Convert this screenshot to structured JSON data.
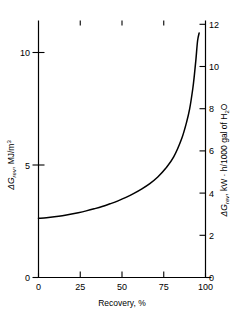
{
  "chart_data": {
    "type": "line",
    "title": "",
    "xlabel": "Recovery, %",
    "ylabel": "ΔG_rev, MJ/m3",
    "ylabel2": "ΔG_rev, kW · h/1000 gal of H2O",
    "xlim": [
      0,
      105
    ],
    "ylim": [
      0,
      11.3
    ],
    "ylim2": [
      0,
      12.6
    ],
    "grid": false,
    "legend": null,
    "xticks": [
      0,
      25,
      50,
      75,
      100
    ],
    "xtick_labels": [
      "0",
      "25",
      "50",
      "75",
      "100"
    ],
    "yticks": [
      0,
      5,
      10
    ],
    "ytick_labels": [
      "0",
      "5",
      "10"
    ],
    "yticks2": [
      0,
      2,
      4,
      6,
      8,
      10,
      12
    ],
    "ytick_labels2": [
      "0",
      "2",
      "4",
      "6",
      "8",
      "10",
      "12"
    ],
    "series": [
      {
        "name": "Reversible free energy of separation",
        "x": [
          0,
          5,
          10,
          15,
          20,
          25,
          30,
          35,
          40,
          45,
          50,
          55,
          60,
          65,
          70,
          75,
          80,
          85,
          90,
          93,
          95,
          97,
          98,
          99,
          100,
          101
        ],
        "values": [
          2.6,
          2.63,
          2.67,
          2.72,
          2.78,
          2.85,
          2.93,
          3.02,
          3.12,
          3.24,
          3.37,
          3.52,
          3.7,
          3.9,
          4.13,
          4.42,
          4.8,
          5.3,
          6.1,
          6.8,
          7.4,
          8.3,
          8.9,
          9.6,
          10.4,
          10.75
        ]
      }
    ]
  },
  "axes": {
    "left": {
      "symbol": "ΔG",
      "subscript": "rev",
      "separator": ", ",
      "unit_main": "MJ/m",
      "unit_exponent": "3"
    },
    "right": {
      "symbol": "ΔG",
      "subscript": "rev",
      "separator": ", ",
      "unit_main": "kW · h/1000 gal of H",
      "unit_subscript": "2",
      "unit_tail": "O"
    },
    "bottom": {
      "label": "Recovery, %"
    }
  },
  "colors": {
    "curve": "#000000",
    "axis": "#000000",
    "background": "#ffffff"
  }
}
